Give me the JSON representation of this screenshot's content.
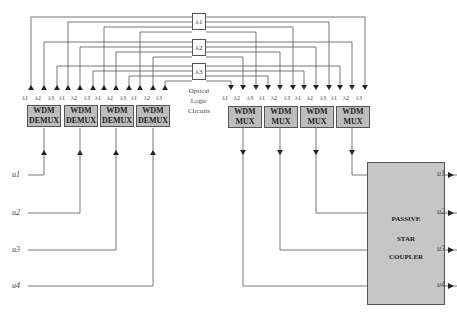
{
  "diagram": {
    "type": "optical-switch-architecture",
    "demux_blocks": [
      {
        "line1": "WDM",
        "line2": "DEMUX",
        "lambdas": [
          "λ1",
          "λ2",
          "λ3"
        ]
      },
      {
        "line1": "WDM",
        "line2": "DEMUX",
        "lambdas": [
          "λ1",
          "λ2",
          "λ3"
        ]
      },
      {
        "line1": "WDM",
        "line2": "DEMUX",
        "lambdas": [
          "λ1",
          "λ2",
          "λ3"
        ]
      },
      {
        "line1": "WDM",
        "line2": "DEMUX",
        "lambdas": [
          "λ1",
          "λ2",
          "λ3"
        ]
      }
    ],
    "mux_blocks": [
      {
        "line1": "WDM",
        "line2": "MUX",
        "lambdas": [
          "λ1",
          "λ2",
          "λ3"
        ]
      },
      {
        "line1": "WDM",
        "line2": "MUX",
        "lambdas": [
          "λ1",
          "λ2",
          "λ3"
        ]
      },
      {
        "line1": "WDM",
        "line2": "MUX",
        "lambdas": [
          "λ1",
          "λ2",
          "λ3"
        ]
      },
      {
        "line1": "WDM",
        "line2": "MUX",
        "lambdas": [
          "λ1",
          "λ2",
          "λ3"
        ]
      }
    ],
    "logic_boxes": [
      "λ1",
      "λ2",
      "λ3"
    ],
    "logic_caption": {
      "line1": "Optical",
      "line2": "Logic",
      "line3": "Circuits"
    },
    "inputs": [
      "u1",
      "u2",
      "u3",
      "u4"
    ],
    "outputs": [
      "u1",
      "u2",
      "u3",
      "u4"
    ],
    "coupler": {
      "line1": "PASSIVE",
      "line2": "STAR",
      "line3": "COUPLER"
    },
    "colors": {
      "block_fill": "#bdbdbd",
      "line": "#444444",
      "background": "#ffffff"
    }
  }
}
